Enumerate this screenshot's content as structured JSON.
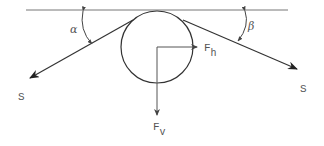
{
  "diagram": {
    "title": "",
    "colors": {
      "line": "#333333",
      "label": "#555555",
      "background": "#ffffff"
    },
    "labels": {
      "alpha": "α",
      "beta": "β",
      "tension_left": "S",
      "tension_right": "S",
      "force_horizontal_main": "F",
      "force_horizontal_sub": "h",
      "force_vertical_main": "F",
      "force_vertical_sub": "v"
    },
    "elements": {
      "ceiling_line": {
        "x1": 26,
        "y1": 10,
        "x2": 288,
        "y2": 10
      },
      "pulley": {
        "cx": 157,
        "cy": 47,
        "r": 36
      },
      "rope_left": {
        "x1": 133,
        "y1": 20,
        "x2": 30,
        "y2": 78
      },
      "rope_right": {
        "x1": 183,
        "y1": 20,
        "x2": 297,
        "y2": 69
      },
      "force_h": {
        "x1": 157,
        "y1": 47,
        "x2": 196,
        "y2": 47
      },
      "force_v": {
        "x1": 157,
        "y1": 47,
        "x2": 157,
        "y2": 115
      }
    }
  }
}
